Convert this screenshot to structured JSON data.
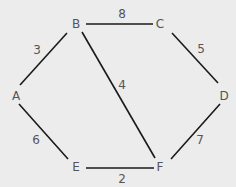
{
  "diagram": {
    "type": "weighted-undirected-graph",
    "background": "#ececec",
    "edge_color": "#1a1a1a",
    "text_color": "#555555",
    "nodes": [
      {
        "id": "A",
        "label": "A",
        "x": 16,
        "y": 96
      },
      {
        "id": "B",
        "label": "B",
        "x": 76,
        "y": 24
      },
      {
        "id": "C",
        "label": "C",
        "x": 160,
        "y": 24
      },
      {
        "id": "D",
        "label": "D",
        "x": 224,
        "y": 96
      },
      {
        "id": "E",
        "label": "E",
        "x": 76,
        "y": 167
      },
      {
        "id": "F",
        "label": "F",
        "x": 160,
        "y": 167
      }
    ],
    "edges": [
      {
        "from": "A",
        "to": "B",
        "weight": "3",
        "x1": 20,
        "y1": 85,
        "x2": 67,
        "y2": 33,
        "lx": 37,
        "ly": 50
      },
      {
        "from": "B",
        "to": "C",
        "weight": "8",
        "x1": 86,
        "y1": 24,
        "x2": 153,
        "y2": 24,
        "lx": 122,
        "ly": 14
      },
      {
        "from": "C",
        "to": "D",
        "weight": "5",
        "x1": 172,
        "y1": 33,
        "x2": 218,
        "y2": 83,
        "lx": 201,
        "ly": 49
      },
      {
        "from": "B",
        "to": "F",
        "weight": "4",
        "x1": 82,
        "y1": 32,
        "x2": 155,
        "y2": 158,
        "lx": 122,
        "ly": 85
      },
      {
        "from": "A",
        "to": "E",
        "weight": "6",
        "x1": 19,
        "y1": 104,
        "x2": 68,
        "y2": 159,
        "lx": 36,
        "ly": 140
      },
      {
        "from": "E",
        "to": "F",
        "weight": "2",
        "x1": 86,
        "y1": 168,
        "x2": 154,
        "y2": 168,
        "lx": 122,
        "ly": 179
      },
      {
        "from": "F",
        "to": "D",
        "weight": "7",
        "x1": 171,
        "y1": 159,
        "x2": 220,
        "y2": 104,
        "lx": 200,
        "ly": 140
      }
    ]
  }
}
